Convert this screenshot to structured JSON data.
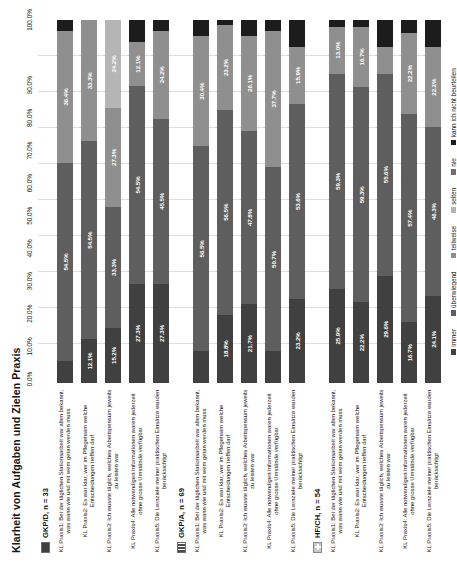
{
  "chart_data": {
    "type": "bar",
    "title": "Klarheit von Aufgaben und Zielen Praxis",
    "xlabel": "",
    "ylabel": "",
    "xlim": [
      0,
      100
    ],
    "stacked": true,
    "orientation": "horizontal",
    "grid": true,
    "legend_position": "bottom",
    "axis_ticks": [
      "0.0%",
      "10.0%",
      "20.0%",
      "30.0%",
      "40.0%",
      "50.0%",
      "60.0%",
      "70.0%",
      "80.0%",
      "90.0%",
      "100.0%"
    ],
    "series": [
      {
        "name": "immer",
        "color": "#404040"
      },
      {
        "name": "überwiegend",
        "color": "#5e5e5e"
      },
      {
        "name": "teilweise",
        "color": "#8f8f8f"
      },
      {
        "name": "selten",
        "color": "#b5b5b5"
      },
      {
        "name": "nie",
        "color": "#6f6f6f"
      },
      {
        "name": "kann ich nicht beurteilen",
        "color": "#1c1c1c"
      }
    ],
    "groups": [
      {
        "name": "GKP/D, n = 33",
        "marker": "solid",
        "bars": [
          {
            "category": "KL Praxis1: Bei der täglichen Stationsarbeit war allen bekannt, was wann wie und mit wem getan werden muss",
            "values": [
              6.1,
              54.5,
              36.4,
              0.0,
              0.0,
              3.0
            ],
            "labels": [
              "",
              "54.5%",
              "36.4%",
              "",
              "",
              ""
            ]
          },
          {
            "category": "KL Praxis2: Es war klar, wer im Pflegeteam welche Entscheidungen treffen darf",
            "values": [
              12.1,
              54.5,
              33.3,
              0.0,
              0.0,
              0.0
            ],
            "labels": [
              "12.1%",
              "54.5%",
              "33.3%",
              "",
              "",
              ""
            ]
          },
          {
            "category": "KL Praxis3: Ich wusste täglich, welches Arbeitspensum jeweils zu leisten war",
            "values": [
              15.2,
              33.3,
              27.3,
              24.2,
              0.0,
              0.0
            ],
            "labels": [
              "15.2%",
              "33.3%",
              "27.3%",
              "24.2%",
              "",
              ""
            ]
          },
          {
            "category": "KL Praxis4: Alle notwendigen Informationen waren jederzeit ohne grosse Umstände verfügbar",
            "values": [
              27.3,
              54.5,
              12.1,
              0.0,
              0.0,
              6.1
            ],
            "labels": [
              "27.3%",
              "54.5%",
              "12.1%",
              "",
              "",
              ""
            ]
          },
          {
            "category": "KL Praxis5: Die Lernziele meiner praktischen Einsätze wurden berücksichtigt",
            "values": [
              27.3,
              45.5,
              24.2,
              0.0,
              0.0,
              3.0
            ],
            "labels": [
              "27.3%",
              "45.5%",
              "24.2%",
              "",
              "",
              ""
            ]
          }
        ]
      },
      {
        "name": "GKP/A, n = 69",
        "marker": "stripe",
        "bars": [
          {
            "category": "KL Praxis1: Bei der täglichen Stationsarbeit war allen bekannt, was wann wie und mit wem getan werden muss",
            "values": [
              8.7,
              56.5,
              30.4,
              0.0,
              0.0,
              4.4
            ],
            "labels": [
              "",
              "56.5%",
              "30.4%",
              "",
              "",
              ""
            ]
          },
          {
            "category": "KL Praxis2: Es war klar, wer im Pflegeteam welche Entscheidungen treffen darf",
            "values": [
              18.8,
              56.5,
              23.2,
              0.0,
              0.0,
              1.5
            ],
            "labels": [
              "18.8%",
              "56.5%",
              "23.2%",
              "",
              "",
              ""
            ]
          },
          {
            "category": "KL Praxis3: Ich wusste täglich, welches Arbeitspensum jeweils zu leisten war",
            "values": [
              21.7,
              47.8,
              26.1,
              0.0,
              0.0,
              4.4
            ],
            "labels": [
              "21.7%",
              "47.8%",
              "26.1%",
              "",
              "",
              ""
            ]
          },
          {
            "category": "KL Praxis4: Alle notwendigen Informationen waren jederzeit ohne grosse Umstände verfügbar",
            "values": [
              8.7,
              50.7,
              37.7,
              0.0,
              0.0,
              2.9
            ],
            "labels": [
              "",
              "50.7%",
              "37.7%",
              "",
              "",
              ""
            ]
          },
          {
            "category": "KL Praxis5: Die Lernziele meiner praktischen Einsätze wurden berücksichtigt",
            "values": [
              23.2,
              53.6,
              15.9,
              0.0,
              0.0,
              7.3
            ],
            "labels": [
              "23.2%",
              "53.6%",
              "15.9%",
              "",
              "",
              ""
            ]
          }
        ]
      },
      {
        "name": "HF/CH, n = 54",
        "marker": "flag",
        "bars": [
          {
            "category": "KL Praxis1: Bei der täglichen Stationsarbeit war allen bekannt, was wann wie und mit wem getan werden muss",
            "values": [
              25.9,
              59.3,
              13.0,
              0.0,
              0.0,
              1.8
            ],
            "labels": [
              "25.9%",
              "59.3%",
              "13.0%",
              "",
              "",
              ""
            ]
          },
          {
            "category": "KL Praxis2: Es war klar, wer im Pflegeteam welche Entscheidungen treffen darf",
            "values": [
              22.2,
              59.3,
              16.7,
              0.0,
              0.0,
              1.8
            ],
            "labels": [
              "22.2%",
              "59.3%",
              "16.7%",
              "",
              "",
              ""
            ]
          },
          {
            "category": "KL Praxis3: Ich wusste täglich, welches Arbeitspensum jeweils zu leisten war",
            "values": [
              29.6,
              55.6,
              7.4,
              0.0,
              0.0,
              7.4
            ],
            "labels": [
              "29.6%",
              "55.6%",
              "",
              "",
              "",
              ""
            ]
          },
          {
            "category": "KL Praxis4: Alle notwendigen Informationen waren jederzeit ohne grosse Umstände verfügbar",
            "values": [
              16.7,
              57.4,
              22.2,
              0.0,
              0.0,
              3.7
            ],
            "labels": [
              "16.7%",
              "57.4%",
              "22.2%",
              "",
              "",
              ""
            ]
          },
          {
            "category": "KL Praxis5: Die Lernziele meiner praktischen Einsätze wurden berücksichtigt",
            "values": [
              24.1,
              46.3,
              22.2,
              0.0,
              0.0,
              7.4
            ],
            "labels": [
              "24.1%",
              "46.3%",
              "22.2%",
              "",
              "",
              ""
            ]
          }
        ]
      }
    ]
  }
}
